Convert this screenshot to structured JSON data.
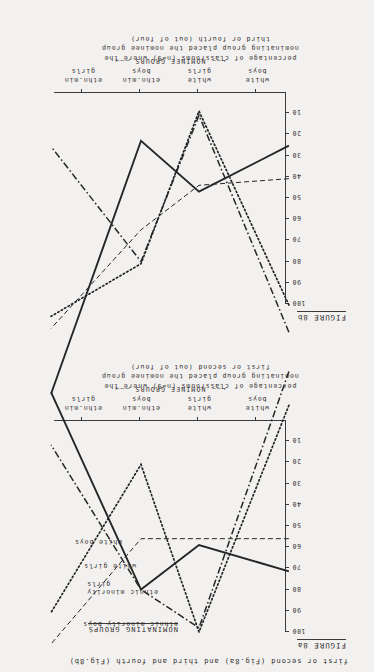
{
  "page": {
    "caption": "first or second (Fig.8a) and third and fourth (Fig.8b)",
    "background_color": "#f2f1ef",
    "ink_color": "#252525"
  },
  "figures": [
    {
      "id": "8a",
      "label": "FIGURE 8a",
      "ylabel_lines": [
        "percentage of classrooms (n=9) where the",
        "nominating group placed the nominee group",
        "first or second (out of four)"
      ],
      "xaxis_title": "NOMINEE GROUPS",
      "legend_title": "NOMINATING GROUPS",
      "chart_data": {
        "type": "line",
        "title": "FIGURE 8a",
        "xlabel": "NOMINEE GROUPS",
        "ylabel": "percentage of classrooms (n=9) where the nominating group placed the nominee group first or second (out of four)",
        "categories": [
          "white boys",
          "white girls",
          "ethn.min boys",
          "ethn.min girls"
        ],
        "ylim": [
          0,
          100
        ],
        "yticks": [
          10,
          20,
          30,
          40,
          50,
          60,
          70,
          80,
          90,
          100
        ],
        "grid": false,
        "legend_position": "upper-right",
        "series": [
          {
            "name": "ethnic minority boys",
            "style": "dashdot",
            "values": [
              20,
              98,
              80,
              36
            ]
          },
          {
            "name": "ethnic minority girls",
            "style": "dashed",
            "values": [
              56,
              56,
              56,
              88
            ]
          },
          {
            "name": "white girls",
            "style": "dotted",
            "values": [
              31,
              100,
              21,
              66
            ]
          },
          {
            "name": "white boys",
            "style": "solid",
            "values": [
              67,
              59,
              80,
              20
            ]
          }
        ]
      }
    },
    {
      "id": "8b",
      "label": "FIGURE 8b",
      "ylabel_lines": [
        "percentage of classrooms (n=9) where the",
        "nominating group placed the nominee group",
        "third or fourth (out of four)"
      ],
      "xaxis_title": "NOMINEE GROUPS",
      "chart_data": {
        "type": "line",
        "title": "FIGURE 8b",
        "xlabel": "NOMINEE GROUPS",
        "ylabel": "percentage of classrooms (n=9) where the nominating group placed the nominee group third or fourth (out of four)",
        "categories": [
          "white boys",
          "white girls",
          "ethn.min boys",
          "ethn.min girls"
        ],
        "ylim": [
          0,
          100
        ],
        "yticks": [
          10,
          20,
          30,
          40,
          50,
          60,
          70,
          80,
          90,
          100
        ],
        "grid": false,
        "legend_position": "none",
        "series": [
          {
            "name": "ethnic minority boys",
            "style": "dashdot",
            "values": [
              77,
              11,
              80,
              45
            ]
          },
          {
            "name": "ethnic minority girls",
            "style": "dashed",
            "values": [
              42,
              44,
              65,
              95
            ]
          },
          {
            "name": "white girls",
            "style": "dotted",
            "values": [
              68,
              9,
              81,
              97
            ]
          },
          {
            "name": "white boys",
            "style": "solid",
            "values": [
              33,
              47,
              23,
              100
            ]
          }
        ]
      }
    }
  ]
}
